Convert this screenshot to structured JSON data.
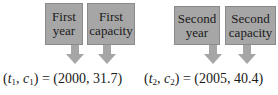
{
  "point1": {
    "labels": {
      "year": "First\nyear",
      "capacity": "First\ncapacity"
    },
    "year_line1": "First",
    "year_line2": "year",
    "cap_line1": "First",
    "cap_line2": "capacity",
    "t_var": "t",
    "c_var": "c",
    "sub": "1",
    "t_value": "2000",
    "c_value": "31.7"
  },
  "point2": {
    "year_line1": "Second",
    "year_line2": "year",
    "cap_line1": "Second",
    "cap_line2": "capacity",
    "t_var": "t",
    "c_var": "c",
    "sub": "2",
    "t_value": "2005",
    "c_value": "40.4"
  },
  "colors": {
    "box_fill": "#a6a6a6",
    "arrow_fill": "#a6a6a6",
    "text": "#1a1a1a"
  }
}
